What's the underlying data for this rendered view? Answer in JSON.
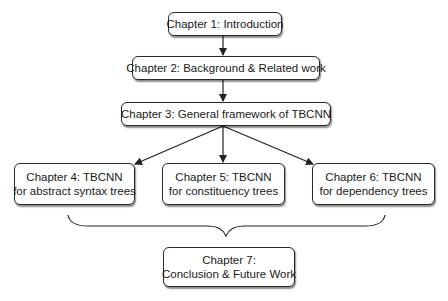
{
  "diagram": {
    "type": "flowchart",
    "nodes": [
      {
        "id": "ch1",
        "lines": [
          "Chapter 1: Introduction"
        ]
      },
      {
        "id": "ch2",
        "lines": [
          "Chapter 2: Background & Related work"
        ]
      },
      {
        "id": "ch3",
        "lines": [
          "Chapter 3: General framework of TBCNN"
        ]
      },
      {
        "id": "ch4",
        "lines": [
          "Chapter 4: TBCNN",
          "for abstract syntax trees"
        ]
      },
      {
        "id": "ch5",
        "lines": [
          "Chapter 5: TBCNN",
          "for constituency trees"
        ]
      },
      {
        "id": "ch6",
        "lines": [
          "Chapter 6: TBCNN",
          "for dependency trees"
        ]
      },
      {
        "id": "ch7",
        "lines": [
          "Chapter 7:",
          "Conclusion & Future Work"
        ]
      }
    ],
    "edges": [
      {
        "from": "ch1",
        "to": "ch2",
        "style": "arrow"
      },
      {
        "from": "ch2",
        "to": "ch3",
        "style": "arrow"
      },
      {
        "from": "ch3",
        "to": "ch4",
        "style": "arrow"
      },
      {
        "from": "ch3",
        "to": "ch5",
        "style": "arrow"
      },
      {
        "from": "ch3",
        "to": "ch6",
        "style": "arrow"
      },
      {
        "from": [
          "ch4",
          "ch5",
          "ch6"
        ],
        "to": "ch7",
        "style": "curly-brace"
      }
    ],
    "colors": {
      "stroke": "#2a2a2a",
      "fill": "#ffffff",
      "text": "#1a1a1a"
    }
  }
}
